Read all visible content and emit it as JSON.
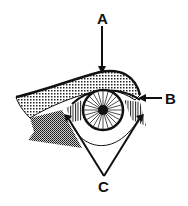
{
  "diagram": {
    "labels": {
      "a": "A",
      "b": "B",
      "c": "C"
    },
    "colors": {
      "ink": "#111111",
      "background": "#ffffff"
    }
  }
}
